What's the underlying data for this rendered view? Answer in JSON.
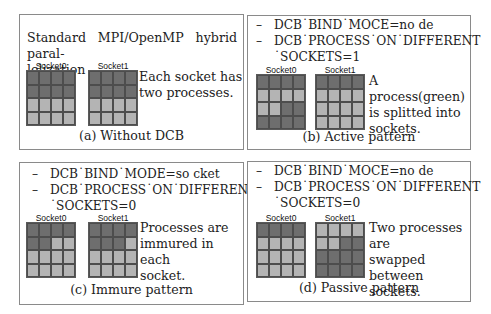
{
  "panels": [
    {
      "id": "a",
      "intro": [
        "Standard MPI/OpenMP hybrid paral-",
        "lelization"
      ],
      "description": [
        "Each socket has",
        "two processes."
      ],
      "caption": "(a) Without DCB",
      "sockets": [
        {
          "label": "Socket0",
          "cells": [
            "d",
            "d",
            "d",
            "d",
            "d",
            "d",
            "d",
            "d",
            "l",
            "l",
            "l",
            "l",
            "l",
            "l",
            "l",
            "l"
          ]
        },
        {
          "label": "Socket1",
          "cells": [
            "d",
            "d",
            "d",
            "d",
            "d",
            "d",
            "d",
            "d",
            "l",
            "l",
            "l",
            "l",
            "l",
            "l",
            "l",
            "l"
          ]
        }
      ]
    },
    {
      "id": "b",
      "options": [
        {
          "bullet": "–",
          "text": "DCB˙BIND˙MOCE=no   de"
        },
        {
          "bullet": "–",
          "text": "DCB˙PROCESS˙ON˙DIFFERENT",
          "continuation": "˙SOCKETS=1"
        }
      ],
      "description": [
        "A process(green)",
        "is splitted into",
        "sockets."
      ],
      "caption": "(b) Active pattern",
      "sockets": [
        {
          "label": "Socket0",
          "cells": [
            "d",
            "d",
            "d",
            "d",
            "l",
            "l",
            "l",
            "l",
            "l",
            "l",
            "d",
            "d",
            "d",
            "d",
            "d",
            "d"
          ]
        },
        {
          "label": "Socket1",
          "cells": [
            "d",
            "d",
            "d",
            "d",
            "l",
            "l",
            "l",
            "l",
            "l",
            "l",
            "l",
            "l",
            "l",
            "l",
            "l",
            "l"
          ]
        }
      ]
    },
    {
      "id": "c",
      "options": [
        {
          "bullet": "–",
          "text": "DCB˙BIND˙MODE=so   cket"
        },
        {
          "bullet": "–",
          "text": "DCB˙PROCESS˙ON˙DIFFERENT",
          "continuation": "˙SOCKETS=0"
        }
      ],
      "description": [
        "Processes are",
        "immured in each",
        "socket."
      ],
      "caption": "(c) Immure pattern",
      "sockets": [
        {
          "label": "Socket0",
          "cells": [
            "d",
            "d",
            "d",
            "d",
            "d",
            "d",
            "l",
            "l",
            "l",
            "l",
            "l",
            "l",
            "l",
            "l",
            "l",
            "l"
          ]
        },
        {
          "label": "Socket1",
          "cells": [
            "d",
            "d",
            "d",
            "d",
            "d",
            "d",
            "d",
            "l",
            "l",
            "l",
            "l",
            "l",
            "l",
            "l",
            "l",
            "l"
          ]
        }
      ]
    },
    {
      "id": "d",
      "options": [
        {
          "bullet": "–",
          "text": "DCB˙BIND˙MOCE=no   de"
        },
        {
          "bullet": "–",
          "text": "DCB˙PROCESS˙ON˙DIFFERENT",
          "continuation": "˙SOCKETS=0"
        }
      ],
      "description": [
        "Two processes are",
        "swapped between",
        "sockets."
      ],
      "caption": "(d) Passive pattern",
      "sockets": [
        {
          "label": "Socket0",
          "cells": [
            "d",
            "d",
            "d",
            "d",
            "l",
            "l",
            "l",
            "l",
            "l",
            "l",
            "l",
            "l",
            "l",
            "l",
            "l",
            "l"
          ]
        },
        {
          "label": "Socket1",
          "cells": [
            "l",
            "l",
            "l",
            "l",
            "l",
            "l",
            "d",
            "d",
            "d",
            "d",
            "d",
            "d",
            "d",
            "d",
            "d",
            "d"
          ]
        }
      ]
    }
  ],
  "colors": {
    "dark_cell": "#6e6e6e",
    "light_cell": "#b4b4b4",
    "grid_line": "#4d4d4d",
    "frame": "#8a8a8a"
  }
}
